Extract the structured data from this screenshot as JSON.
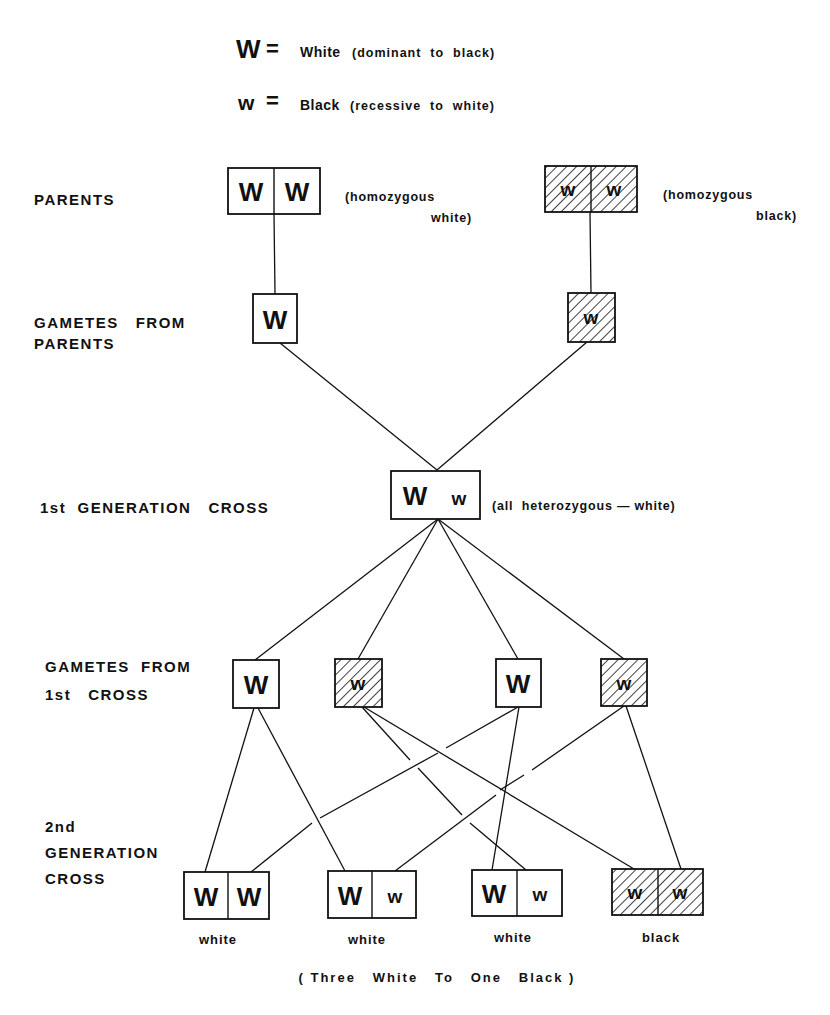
{
  "legend": {
    "dominant": {
      "symbol": "W",
      "equals": "=",
      "label": "White",
      "detail": "(dominant  to  black)"
    },
    "recessive": {
      "symbol": "w",
      "equals": "=",
      "label": "Black",
      "detail": "(recessive  to  white)"
    }
  },
  "rows": {
    "parents": {
      "label": "PARENTS"
    },
    "gametes_parents": {
      "label_line1": "GAMETES   FROM",
      "label_line2": "PARENTS"
    },
    "f1": {
      "label": "1st  GENERATION   CROSS"
    },
    "gametes_f1": {
      "label_line1": "GAMETES  FROM",
      "label_line2": "1st   CROSS"
    },
    "f2": {
      "label_line1": "2nd",
      "label_line2": "GENERATION",
      "label_line3": "CROSS"
    }
  },
  "parents": [
    {
      "alleles": [
        "W",
        "W"
      ],
      "color": "white",
      "note_line1": "(homozygous",
      "note_line2": "white)"
    },
    {
      "alleles": [
        "w",
        "w"
      ],
      "color": "black",
      "note_line1": "(homozygous",
      "note_line2": "black)"
    }
  ],
  "gametes_parents": [
    {
      "allele": "W",
      "color": "white"
    },
    {
      "allele": "w",
      "color": "black"
    }
  ],
  "f1": {
    "alleles": [
      "W",
      "w"
    ],
    "note": "(all  heterozygous — white)"
  },
  "gametes_f1": [
    {
      "allele": "W",
      "color": "white"
    },
    {
      "allele": "w",
      "color": "black"
    },
    {
      "allele": "W",
      "color": "white"
    },
    {
      "allele": "w",
      "color": "black"
    }
  ],
  "f2": [
    {
      "alleles": [
        "W",
        "W"
      ],
      "phenotype": "white"
    },
    {
      "alleles": [
        "W",
        "w"
      ],
      "phenotype": "white"
    },
    {
      "alleles": [
        "W",
        "w"
      ],
      "phenotype": "white"
    },
    {
      "alleles": [
        "w",
        "w"
      ],
      "phenotype": "black"
    }
  ],
  "summary": "( Three   White   To   One   Black )",
  "colors": {
    "ink": "#111111",
    "paper": "#ffffff"
  }
}
